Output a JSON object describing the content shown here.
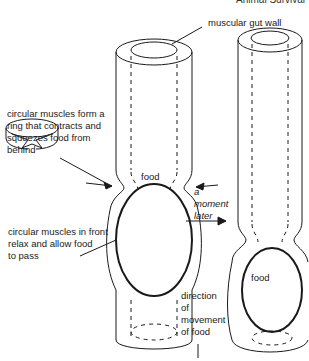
{
  "header": {
    "text": "Animal Survival"
  },
  "labels": {
    "gut_wall": "muscular gut wall",
    "contract_line1": "circular muscles form a",
    "contract_line2": "ring that contracts and",
    "contract_line3": "squeezes food from",
    "contract_line4": "behind",
    "relax_line1": "circular muscles in front",
    "relax_line2": "relax and allow food",
    "relax_line3": "to pass",
    "food_left": "food",
    "food_right": "food",
    "moment_line1": "a",
    "moment_line2": "moment",
    "moment_line3": "later",
    "direction_line1": "direction",
    "direction_line2": "of",
    "direction_line3": "movement",
    "direction_line4": "of food"
  },
  "colors": {
    "line": "#1a1a1a",
    "background": "#ffffff"
  }
}
